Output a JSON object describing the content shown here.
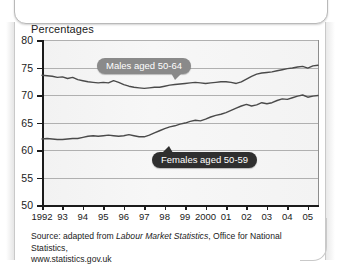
{
  "chart": {
    "title": "Percentages",
    "source_line1_pre": "Source: adapted from ",
    "source_line1_em": "Labour Market Statistics",
    "source_line1_post": ", Office for National Statistics,",
    "source_line2": "www.statistics.gov.uk",
    "label_males": "Males aged 50-64",
    "label_females": "Females aged 50-59"
  },
  "chart_data": {
    "type": "line",
    "title": "Percentages",
    "xlabel": "",
    "ylabel": "Percentages",
    "ylim": [
      50,
      80
    ],
    "xlim": [
      1992,
      2005.5
    ],
    "grid": true,
    "legend": "inline-callout",
    "yticks": [
      50,
      55,
      60,
      65,
      70,
      75,
      80
    ],
    "xticks": [
      1992,
      1993,
      1994,
      1995,
      1996,
      1997,
      1998,
      1999,
      2000,
      2001,
      2002,
      2003,
      2004,
      2005
    ],
    "xtick_labels": [
      "1992",
      "93",
      "94",
      "95",
      "96",
      "97",
      "98",
      "99",
      "2000",
      "01",
      "02",
      "03",
      "04",
      "05"
    ],
    "series": [
      {
        "name": "Males aged 50-64",
        "color": "#4a4a4a",
        "x": [
          1992.0,
          1992.25,
          1992.5,
          1992.75,
          1993.0,
          1993.25,
          1993.5,
          1993.75,
          1994.0,
          1994.25,
          1994.5,
          1994.75,
          1995.0,
          1995.25,
          1995.5,
          1995.75,
          1996.0,
          1996.25,
          1996.5,
          1996.75,
          1997.0,
          1997.25,
          1997.5,
          1997.75,
          1998.0,
          1998.25,
          1998.5,
          1998.75,
          1999.0,
          1999.25,
          1999.5,
          1999.75,
          2000.0,
          2000.25,
          2000.5,
          2000.75,
          2001.0,
          2001.25,
          2001.5,
          2001.75,
          2002.0,
          2002.25,
          2002.5,
          2002.75,
          2003.0,
          2003.25,
          2003.5,
          2003.75,
          2004.0,
          2004.25,
          2004.5,
          2004.75,
          2005.0,
          2005.25,
          2005.5
        ],
        "y": [
          73.6,
          73.5,
          73.4,
          73.2,
          73.3,
          73.0,
          73.2,
          72.8,
          72.6,
          72.4,
          72.3,
          72.2,
          72.3,
          72.2,
          72.6,
          72.3,
          71.9,
          71.6,
          71.4,
          71.3,
          71.2,
          71.3,
          71.4,
          71.4,
          71.6,
          71.8,
          71.9,
          72.0,
          72.1,
          72.2,
          72.3,
          72.2,
          72.1,
          72.2,
          72.3,
          72.4,
          72.4,
          72.3,
          72.1,
          72.4,
          72.9,
          73.4,
          73.8,
          74.0,
          74.1,
          74.2,
          74.4,
          74.6,
          74.8,
          74.9,
          75.1,
          75.2,
          74.9,
          75.3,
          75.4
        ]
      },
      {
        "name": "Females aged 50-59",
        "color": "#4a4a4a",
        "x": [
          1992.0,
          1992.25,
          1992.5,
          1992.75,
          1993.0,
          1993.25,
          1993.5,
          1993.75,
          1994.0,
          1994.25,
          1994.5,
          1994.75,
          1995.0,
          1995.25,
          1995.5,
          1995.75,
          1996.0,
          1996.25,
          1996.5,
          1996.75,
          1997.0,
          1997.25,
          1997.5,
          1997.75,
          1998.0,
          1998.25,
          1998.5,
          1998.75,
          1999.0,
          1999.25,
          1999.5,
          1999.75,
          2000.0,
          2000.25,
          2000.5,
          2000.75,
          2001.0,
          2001.25,
          2001.5,
          2001.75,
          2002.0,
          2002.25,
          2002.5,
          2002.75,
          2003.0,
          2003.25,
          2003.5,
          2003.75,
          2004.0,
          2004.25,
          2004.5,
          2004.75,
          2005.0,
          2005.25,
          2005.5
        ],
        "y": [
          62.0,
          62.1,
          62.0,
          61.9,
          61.9,
          62.0,
          62.1,
          62.1,
          62.3,
          62.5,
          62.6,
          62.5,
          62.6,
          62.7,
          62.6,
          62.5,
          62.6,
          62.8,
          62.6,
          62.4,
          62.4,
          62.7,
          63.1,
          63.5,
          63.9,
          64.2,
          64.4,
          64.7,
          64.9,
          65.2,
          65.4,
          65.3,
          65.6,
          66.0,
          66.3,
          66.5,
          66.8,
          67.2,
          67.6,
          68.0,
          68.3,
          68.0,
          68.2,
          68.6,
          68.4,
          68.6,
          69.0,
          69.3,
          69.2,
          69.5,
          69.8,
          70.0,
          69.6,
          69.8,
          69.9
        ]
      }
    ]
  }
}
